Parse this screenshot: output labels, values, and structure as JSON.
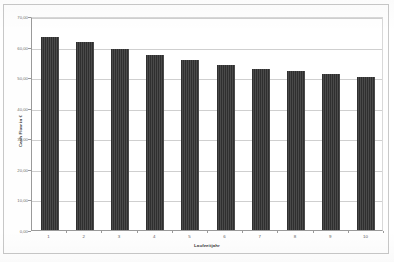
{
  "chart_data": {
    "type": "bar",
    "title": "",
    "xlabel": "Laufzeitjahr",
    "ylabel": "Cash Flow in €",
    "categories": [
      "1",
      "2",
      "3",
      "4",
      "5",
      "6",
      "7",
      "8",
      "9",
      "10"
    ],
    "values": [
      63.0,
      61.5,
      59.2,
      57.3,
      55.5,
      54.0,
      52.8,
      52.0,
      51.0,
      50.2
    ],
    "ylim": [
      0,
      70
    ],
    "ytick_labels": [
      "0,00",
      "10,00",
      "20,00",
      "30,00",
      "40,00",
      "50,00",
      "60,00",
      "70,00"
    ],
    "ytick_values": [
      0,
      10,
      20,
      30,
      40,
      50,
      60,
      70
    ],
    "grid": true,
    "legend": "none",
    "series_color": "#3a3a3a",
    "gridline_color": "#cfcfcf",
    "axis_color": "#9a9a9a",
    "background_color": "#ffffff"
  }
}
